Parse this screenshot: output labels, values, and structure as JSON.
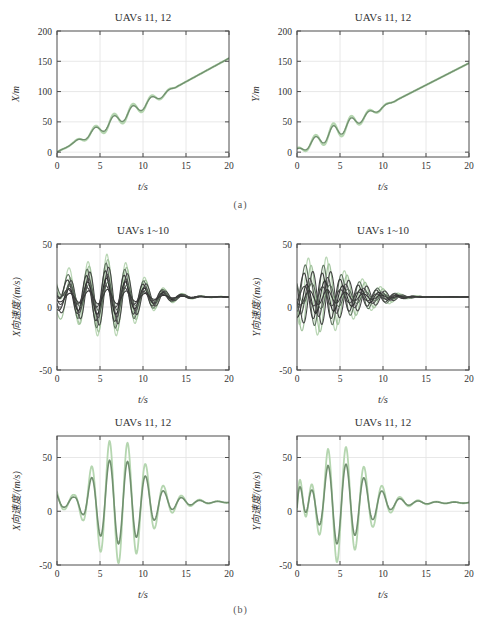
{
  "figure": {
    "caption_a": "(a)",
    "caption_b": "(b)"
  },
  "palette": {
    "frame": "#4d4d4d",
    "grid": "#e2e2e2",
    "text": "#3a3a3a",
    "light_green": "#b5d6b0",
    "dark_green": "#71906f"
  },
  "charts": [
    {
      "type": "line",
      "title": "UAVs 11, 12",
      "xlabel": "t/s",
      "ylabel": "X/m",
      "xlim": [
        0,
        20
      ],
      "ylim": [
        -8,
        200
      ],
      "xticks": [
        0,
        5,
        10,
        15,
        20
      ],
      "yticks": [
        0,
        50,
        100,
        150,
        200
      ],
      "grid": true,
      "legend": "none",
      "omega": 2.856,
      "t0": 1.65,
      "base": {
        "slope": 7.75,
        "intercept": 0
      },
      "envelope": [
        [
          0,
          0
        ],
        [
          2,
          0.15
        ],
        [
          3,
          0.45
        ],
        [
          4.5,
          0.75
        ],
        [
          6,
          1
        ],
        [
          8,
          1
        ],
        [
          10,
          0.85
        ],
        [
          11.5,
          0.6
        ],
        [
          13,
          0.3
        ],
        [
          14,
          0
        ],
        [
          20,
          0
        ]
      ],
      "series": [
        {
          "name": "UAV 12",
          "color": "#b5d6b0",
          "width": 2.2,
          "amp": 12,
          "jitter": 0,
          "startOffset": 0
        },
        {
          "name": "UAV 11",
          "color": "#71906f",
          "width": 1.4,
          "amp": 8.6,
          "jitter": 0,
          "startOffset": 0
        }
      ]
    },
    {
      "type": "line",
      "title": "UAVs 11, 12",
      "xlabel": "t/s",
      "ylabel": "Y/m",
      "xlim": [
        0,
        20
      ],
      "ylim": [
        -8,
        200
      ],
      "xticks": [
        0,
        5,
        10,
        15,
        20
      ],
      "yticks": [
        0,
        50,
        100,
        150,
        200
      ],
      "grid": true,
      "legend": "none",
      "omega": 2.99,
      "t0": 1.575,
      "base": {
        "slope": 7.25,
        "intercept": 2
      },
      "envelope": [
        [
          0,
          0.3
        ],
        [
          2,
          0.7
        ],
        [
          4.2,
          1
        ],
        [
          6,
          0.85
        ],
        [
          8,
          0.5
        ],
        [
          9.5,
          0.3
        ],
        [
          11,
          0.08
        ],
        [
          11.8,
          0
        ],
        [
          20,
          0
        ]
      ],
      "series": [
        {
          "name": "UAV 12",
          "color": "#b5d6b0",
          "width": 2.2,
          "amp": 15,
          "jitter": 0,
          "startOffset": 0
        },
        {
          "name": "UAV 11",
          "color": "#71906f",
          "width": 1.4,
          "amp": 11,
          "jitter": 0,
          "startOffset": 0
        }
      ]
    },
    {
      "type": "line",
      "title": "UAVs 1~10",
      "xlabel": "t/s",
      "ylabel": "X向速度/(m/s)",
      "xlim": [
        0,
        20
      ],
      "ylim": [
        -50,
        50
      ],
      "xticks": [
        0,
        5,
        10,
        15,
        20
      ],
      "yticks": [
        -50,
        0,
        50
      ],
      "grid": true,
      "legend": "none",
      "omega": 2.856,
      "t0": 3.05,
      "base": {
        "value": 8
      },
      "envelope": [
        [
          0,
          0.35
        ],
        [
          1,
          0.5
        ],
        [
          2,
          0.62
        ],
        [
          3,
          0.75
        ],
        [
          4.5,
          0.9
        ],
        [
          5.8,
          1
        ],
        [
          7,
          0.9
        ],
        [
          8,
          0.8
        ],
        [
          9.5,
          0.55
        ],
        [
          11,
          0.35
        ],
        [
          12.5,
          0.2
        ],
        [
          14,
          0.1
        ],
        [
          15.5,
          0.05
        ],
        [
          17,
          0.02
        ],
        [
          20,
          0.01
        ]
      ],
      "series": [
        {
          "name": "UAV 1",
          "color": "#b9d6b4",
          "width": 1.2,
          "amp": 34,
          "jitter": 0,
          "startOffset": 18
        },
        {
          "name": "UAV 2",
          "color": "#a3c49e",
          "width": 1.2,
          "amp": 30,
          "jitter": 0.12,
          "startOffset": -8
        },
        {
          "name": "UAV 3",
          "color": "#5f735f",
          "width": 1.1,
          "amp": 27,
          "jitter": -0.1,
          "startOffset": 12
        },
        {
          "name": "UAV 4",
          "color": "#474747",
          "width": 1.1,
          "amp": 24,
          "jitter": 0.2,
          "startOffset": -4
        },
        {
          "name": "UAV 5",
          "color": "#3c3c3c",
          "width": 1.1,
          "amp": 21,
          "jitter": -0.18,
          "startOffset": 8
        },
        {
          "name": "UAV 6",
          "color": "#515151",
          "width": 1.1,
          "amp": 18,
          "jitter": 0.05,
          "startOffset": 2
        },
        {
          "name": "UAV 7",
          "color": "#2f2f2f",
          "width": 1.1,
          "amp": 15,
          "jitter": -0.05,
          "startOffset": -6
        },
        {
          "name": "UAV 8",
          "color": "#5a6b5a",
          "width": 1.1,
          "amp": 12,
          "jitter": 0.15,
          "startOffset": 10
        },
        {
          "name": "UAV 9",
          "color": "#444444",
          "width": 1.1,
          "amp": 9,
          "jitter": -0.12,
          "startOffset": 4
        },
        {
          "name": "UAV 10",
          "color": "#383838",
          "width": 1.1,
          "amp": 6,
          "jitter": 0.08,
          "startOffset": -2
        }
      ]
    },
    {
      "type": "line",
      "title": "UAVs 1~10",
      "xlabel": "t/s",
      "ylabel": "Y向速度/(m/s)",
      "xlim": [
        0,
        20
      ],
      "ylim": [
        -50,
        50
      ],
      "xticks": [
        0,
        5,
        10,
        15,
        20
      ],
      "yticks": [
        -50,
        0,
        50
      ],
      "grid": true,
      "legend": "none",
      "omega": 2.99,
      "t0": 0.8,
      "base": {
        "value": 8
      },
      "envelope": [
        [
          0,
          0.8
        ],
        [
          1,
          0.9
        ],
        [
          2,
          0.95
        ],
        [
          3.3,
          1
        ],
        [
          4.4,
          0.85
        ],
        [
          5.5,
          0.65
        ],
        [
          6.6,
          0.55
        ],
        [
          7.6,
          0.45
        ],
        [
          8.7,
          0.33
        ],
        [
          9.8,
          0.25
        ],
        [
          11,
          0.15
        ],
        [
          12,
          0.08
        ],
        [
          13,
          0.04
        ],
        [
          15,
          0.01
        ],
        [
          20,
          0.005
        ]
      ],
      "series": [
        {
          "name": "UAV 1",
          "color": "#b9d6b4",
          "width": 1.2,
          "amp": 32,
          "jitter": 0,
          "startOffset": 6
        },
        {
          "name": "UAV 2",
          "color": "#a3c49e",
          "width": 1.2,
          "amp": 28,
          "jitter": 0.3,
          "startOffset": -5
        },
        {
          "name": "UAV 3",
          "color": "#5f735f",
          "width": 1.1,
          "amp": 25,
          "jitter": -0.35,
          "startOffset": 8
        },
        {
          "name": "UAV 4",
          "color": "#474747",
          "width": 1.1,
          "amp": 22,
          "jitter": 0.5,
          "startOffset": -3
        },
        {
          "name": "UAV 5",
          "color": "#3c3c3c",
          "width": 1.1,
          "amp": 19,
          "jitter": -0.5,
          "startOffset": 5
        },
        {
          "name": "UAV 6",
          "color": "#515151",
          "width": 1.1,
          "amp": 16,
          "jitter": 0.15,
          "startOffset": 0
        },
        {
          "name": "UAV 7",
          "color": "#2f2f2f",
          "width": 1.1,
          "amp": 13,
          "jitter": -0.2,
          "startOffset": -6
        },
        {
          "name": "UAV 8",
          "color": "#5a6b5a",
          "width": 1.1,
          "amp": 10,
          "jitter": 0.4,
          "startOffset": 7
        },
        {
          "name": "UAV 9",
          "color": "#444444",
          "width": 1.1,
          "amp": 8,
          "jitter": -0.45,
          "startOffset": 3
        },
        {
          "name": "UAV 10",
          "color": "#383838",
          "width": 1.1,
          "amp": 6,
          "jitter": 0.1,
          "startOffset": -2
        }
      ]
    },
    {
      "type": "line",
      "title": "UAVs 11, 12",
      "xlabel": "t/s",
      "ylabel": "X向速度/(m/s)",
      "xlim": [
        0,
        20
      ],
      "ylim": [
        -50,
        70
      ],
      "xticks": [
        0,
        5,
        10,
        15,
        20
      ],
      "yticks": [
        -50,
        0,
        50
      ],
      "grid": true,
      "legend": "none",
      "omega": 2.99,
      "t0": 1.375,
      "base": {
        "value": 8.5
      },
      "envelope": [
        [
          0,
          0.2
        ],
        [
          0.8,
          0.12
        ],
        [
          2,
          0.12
        ],
        [
          3,
          0.3
        ],
        [
          4,
          0.58
        ],
        [
          5,
          0.8
        ],
        [
          6.1,
          1
        ],
        [
          7.1,
          1
        ],
        [
          8.2,
          0.97
        ],
        [
          9.2,
          0.85
        ],
        [
          10.3,
          0.62
        ],
        [
          11.4,
          0.42
        ],
        [
          12.5,
          0.25
        ],
        [
          13.6,
          0.16
        ],
        [
          14.6,
          0.1
        ],
        [
          16,
          0.05
        ],
        [
          18,
          0.02
        ],
        [
          20,
          0.01
        ]
      ],
      "series": [
        {
          "name": "UAV 12",
          "color": "#b5d6b0",
          "width": 1.8,
          "amp": 57,
          "jitter": 0,
          "startOffset": 0
        },
        {
          "name": "UAV 11",
          "color": "#71906f",
          "width": 1.6,
          "amp": 39,
          "jitter": 0,
          "startOffset": 0
        }
      ]
    },
    {
      "type": "line",
      "title": "UAVs 11, 12",
      "xlabel": "t/s",
      "ylabel": "Y向速度/(m/s)",
      "xlim": [
        0,
        20
      ],
      "ylim": [
        -50,
        70
      ],
      "xticks": [
        0,
        5,
        10,
        15,
        20
      ],
      "yticks": [
        -50,
        0,
        50
      ],
      "grid": true,
      "legend": "none",
      "omega": 2.99,
      "t0": 0.975,
      "base": {
        "value": 8
      },
      "envelope": [
        [
          0,
          0.1
        ],
        [
          1,
          0.1
        ],
        [
          2,
          0.3
        ],
        [
          2.9,
          0.6
        ],
        [
          3.6,
          0.95
        ],
        [
          4.6,
          1.08
        ],
        [
          5.7,
          1
        ],
        [
          6.7,
          0.85
        ],
        [
          7.8,
          0.64
        ],
        [
          8.8,
          0.44
        ],
        [
          9.9,
          0.3
        ],
        [
          11,
          0.17
        ],
        [
          12,
          0.1
        ],
        [
          13.5,
          0.05
        ],
        [
          16,
          0.02
        ],
        [
          20,
          0.01
        ]
      ],
      "series": [
        {
          "name": "UAV 12",
          "color": "#b5d6b0",
          "width": 1.8,
          "amp": 52,
          "jitter": 0,
          "startOffset": 0,
          "transient": {
            "amp": 36,
            "decay": 0.83,
            "omega": 4.3,
            "t0": 0.035
          }
        },
        {
          "name": "UAV 11",
          "color": "#71906f",
          "width": 1.6,
          "amp": 36,
          "jitter": 0,
          "startOffset": 0,
          "transient": {
            "amp": 25,
            "decay": 0.83,
            "omega": 4.3,
            "t0": 0.035
          }
        }
      ]
    }
  ]
}
